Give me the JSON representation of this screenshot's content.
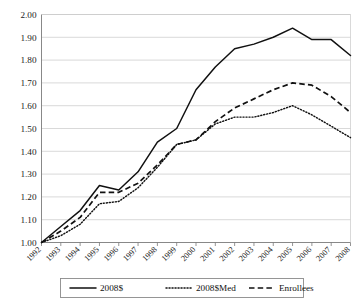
{
  "chart_data": {
    "type": "line",
    "title": "",
    "subtitle": "",
    "xlabel": "",
    "ylabel": "",
    "x": [
      1992,
      1993,
      1994,
      1995,
      1996,
      1997,
      1998,
      1999,
      2000,
      2001,
      2002,
      2003,
      2004,
      2005,
      2006,
      2007,
      2008
    ],
    "categories": [
      "1992",
      "1993",
      "1994",
      "1995",
      "1996",
      "1997",
      "1998",
      "1999",
      "2000",
      "2001",
      "2002",
      "2003",
      "2004",
      "2005",
      "2006",
      "2007",
      "2008"
    ],
    "xlim": [
      1992,
      2008
    ],
    "ylim": [
      1.0,
      2.0
    ],
    "ytick_values": [
      1.0,
      1.1,
      1.2,
      1.3,
      1.4,
      1.5,
      1.6,
      1.7,
      1.8,
      1.9,
      2.0
    ],
    "ytick_labels": [
      "1.00",
      "1.10",
      "1.20",
      "1.30",
      "1.40",
      "1.50",
      "1.60",
      "1.70",
      "1.80",
      "1.90",
      "2.00"
    ],
    "grid": true,
    "grid_axis": "y",
    "legend_position": "bottom",
    "series": [
      {
        "name": "2008$",
        "style": "solid",
        "color": "#111111",
        "values": [
          1.0,
          1.07,
          1.14,
          1.25,
          1.23,
          1.31,
          1.44,
          1.5,
          1.67,
          1.77,
          1.85,
          1.87,
          1.9,
          1.94,
          1.89,
          1.89,
          1.82
        ]
      },
      {
        "name": "2008$Med",
        "style": "dotted",
        "color": "#111111",
        "values": [
          1.0,
          1.03,
          1.08,
          1.17,
          1.18,
          1.24,
          1.33,
          1.43,
          1.45,
          1.52,
          1.55,
          1.55,
          1.57,
          1.6,
          1.56,
          1.51,
          1.46
        ]
      },
      {
        "name": "Enrollees",
        "style": "dashed",
        "color": "#111111",
        "values": [
          1.0,
          1.05,
          1.11,
          1.22,
          1.22,
          1.26,
          1.34,
          1.43,
          1.45,
          1.53,
          1.59,
          1.63,
          1.67,
          1.7,
          1.69,
          1.64,
          1.57
        ]
      }
    ]
  },
  "legend": {
    "items": [
      {
        "label": "2008$",
        "style": "solid"
      },
      {
        "label": "2008$Med",
        "style": "dotted"
      },
      {
        "label": "Enrollees",
        "style": "dashed"
      }
    ]
  }
}
